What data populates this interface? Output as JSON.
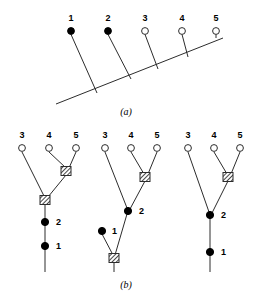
{
  "figure": {
    "panels": [
      {
        "id": "a",
        "caption": "(a)",
        "caption_x": 126,
        "caption_y": 115,
        "description": "Stratigraphic ladder tree with an oblique backbone and five vertical branches",
        "backbone": {
          "x1": 56,
          "y1": 104,
          "x2": 223,
          "y2": 38
        },
        "tips": [
          {
            "label": "1",
            "x": 71,
            "y": 31,
            "label_x": 71,
            "label_y": 21,
            "state": "filled",
            "base_x": 97,
            "base_y": 93
          },
          {
            "label": "2",
            "x": 108,
            "y": 31,
            "label_x": 108,
            "label_y": 21,
            "state": "filled",
            "base_x": 131,
            "base_y": 79
          },
          {
            "label": "3",
            "x": 145,
            "y": 31,
            "label_x": 145,
            "label_y": 21,
            "state": "open",
            "base_x": 158,
            "base_y": 69
          },
          {
            "label": "4",
            "x": 182,
            "y": 31,
            "label_x": 182,
            "label_y": 21,
            "state": "open",
            "base_x": 188,
            "base_y": 57
          },
          {
            "label": "5",
            "x": 216,
            "y": 31,
            "label_x": 216,
            "label_y": 21,
            "state": "open",
            "base_x": 216,
            "base_y": 38
          }
        ]
      },
      {
        "id": "b",
        "caption": "(b)",
        "caption_x": 126,
        "caption_y": 288,
        "description": "Three alternative cladogram resolutions of the same five taxa",
        "trees": [
          {
            "name": "tree-left",
            "tips": [
              {
                "label": "3",
                "x": 22,
                "y": 148,
                "label_x": 22,
                "label_y": 138,
                "state": "open"
              },
              {
                "label": "4",
                "x": 49,
                "y": 148,
                "label_x": 49,
                "label_y": 138,
                "state": "open"
              },
              {
                "label": "5",
                "x": 76,
                "y": 148,
                "label_x": 76,
                "label_y": 138,
                "state": "open"
              }
            ],
            "nodes": [
              {
                "type": "hatched",
                "x": 66,
                "y": 171,
                "label": "",
                "label_x": 0,
                "label_y": 0
              },
              {
                "type": "hatched",
                "x": 45,
                "y": 200,
                "label": "",
                "label_x": 0,
                "label_y": 0
              },
              {
                "type": "filled",
                "x": 45,
                "y": 222,
                "label": "2",
                "label_x": 56,
                "label_y": 225
              },
              {
                "type": "filled",
                "x": 45,
                "y": 246,
                "label": "1",
                "label_x": 56,
                "label_y": 249
              }
            ],
            "edges": [
              {
                "x1": 22,
                "y1": 152,
                "x2": 45,
                "y2": 198
              },
              {
                "x1": 49,
                "y1": 152,
                "x2": 66,
                "y2": 168
              },
              {
                "x1": 76,
                "y1": 152,
                "x2": 69,
                "y2": 168
              },
              {
                "x1": 66,
                "y1": 175,
                "x2": 48,
                "y2": 197
              },
              {
                "x1": 45,
                "y1": 204,
                "x2": 45,
                "y2": 272
              }
            ]
          },
          {
            "name": "tree-middle",
            "tips": [
              {
                "label": "3",
                "x": 105,
                "y": 148,
                "label_x": 105,
                "label_y": 138,
                "state": "open"
              },
              {
                "label": "4",
                "x": 131,
                "y": 148,
                "label_x": 131,
                "label_y": 138,
                "state": "open"
              },
              {
                "label": "5",
                "x": 157,
                "y": 148,
                "label_x": 157,
                "label_y": 138,
                "state": "open"
              }
            ],
            "nodes": [
              {
                "type": "hatched",
                "x": 145,
                "y": 177,
                "label": "",
                "label_x": 0,
                "label_y": 0
              },
              {
                "type": "filled",
                "x": 128,
                "y": 211,
                "label": "2",
                "label_x": 139,
                "label_y": 214
              },
              {
                "type": "filled",
                "x": 102,
                "y": 231,
                "label": "1",
                "label_x": 112,
                "label_y": 234
              },
              {
                "type": "hatched",
                "x": 114,
                "y": 258,
                "label": "",
                "label_x": 0,
                "label_y": 0
              }
            ],
            "edges": [
              {
                "x1": 105,
                "y1": 152,
                "x2": 127,
                "y2": 208
              },
              {
                "x1": 131,
                "y1": 152,
                "x2": 144,
                "y2": 174
              },
              {
                "x1": 157,
                "y1": 152,
                "x2": 148,
                "y2": 174
              },
              {
                "x1": 145,
                "y1": 181,
                "x2": 130,
                "y2": 209
              },
              {
                "x1": 127,
                "y1": 214,
                "x2": 115,
                "y2": 255
              },
              {
                "x1": 102,
                "y1": 234,
                "x2": 113,
                "y2": 255
              },
              {
                "x1": 114,
                "y1": 262,
                "x2": 114,
                "y2": 272
              }
            ]
          },
          {
            "name": "tree-right",
            "tips": [
              {
                "label": "3",
                "x": 188,
                "y": 148,
                "label_x": 188,
                "label_y": 138,
                "state": "open"
              },
              {
                "label": "4",
                "x": 214,
                "y": 148,
                "label_x": 214,
                "label_y": 138,
                "state": "open"
              },
              {
                "label": "5",
                "x": 240,
                "y": 148,
                "label_x": 240,
                "label_y": 138,
                "state": "open"
              }
            ],
            "nodes": [
              {
                "type": "hatched",
                "x": 228,
                "y": 177,
                "label": "",
                "label_x": 0,
                "label_y": 0
              },
              {
                "type": "filled",
                "x": 210,
                "y": 215,
                "label": "2",
                "label_x": 221,
                "label_y": 218
              },
              {
                "type": "filled",
                "x": 210,
                "y": 252,
                "label": "1",
                "label_x": 221,
                "label_y": 255
              }
            ],
            "edges": [
              {
                "x1": 188,
                "y1": 152,
                "x2": 209,
                "y2": 212
              },
              {
                "x1": 214,
                "y1": 152,
                "x2": 227,
                "y2": 174
              },
              {
                "x1": 240,
                "y1": 152,
                "x2": 231,
                "y2": 174
              },
              {
                "x1": 228,
                "y1": 181,
                "x2": 212,
                "y2": 213
              },
              {
                "x1": 210,
                "y1": 218,
                "x2": 210,
                "y2": 272
              }
            ]
          }
        ]
      }
    ],
    "legend": {
      "filled_meaning": "ancestral / fossil taxon",
      "open_meaning": "terminal taxon",
      "hatched_meaning": "hypothetical ancestor node"
    },
    "colors": {
      "line": "#2c2c2c",
      "fill_node": "#000000",
      "open_node": "#ffffff",
      "background": "#ffffff"
    }
  }
}
